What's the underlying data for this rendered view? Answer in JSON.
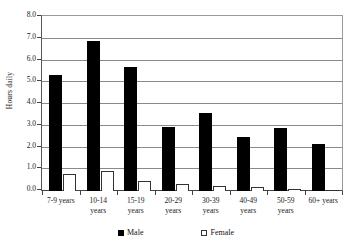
{
  "chart_data": {
    "type": "bar",
    "title": "",
    "xlabel": "",
    "ylabel": "Hours daily",
    "ylim": [
      0,
      8
    ],
    "ytick_step": 1,
    "grid": true,
    "legend_position": "bottom",
    "categories": [
      "7-9 years",
      "10-14 years",
      "15-19 years",
      "20-29 years",
      "30-39 years",
      "40-49 years",
      "50-59 years",
      "60+ years"
    ],
    "category_lines": [
      [
        "7-9 years"
      ],
      [
        "10-14",
        "years"
      ],
      [
        "15-19",
        "years"
      ],
      [
        "20-29",
        "years"
      ],
      [
        "30-39",
        "years"
      ],
      [
        "40-49",
        "years"
      ],
      [
        "50-59",
        "years"
      ],
      [
        "60+ years"
      ]
    ],
    "ytick_labels": [
      "8.0",
      "7.0",
      "6.0",
      "5.0",
      "4.0",
      "3.0",
      "2.0",
      "1.0",
      "0.0"
    ],
    "series": [
      {
        "name": "Male",
        "color": "#000000",
        "values": [
          5.35,
          6.9,
          5.7,
          2.95,
          3.6,
          2.5,
          2.9,
          2.15
        ]
      },
      {
        "name": "Female",
        "color": "#ffffff",
        "values": [
          0.78,
          0.9,
          0.48,
          0.32,
          0.25,
          0.18,
          0.07,
          0.05
        ]
      }
    ]
  },
  "legend": {
    "items": [
      {
        "label": "Male",
        "swatch": "filled-square-icon"
      },
      {
        "label": "Female",
        "swatch": "empty-square-icon"
      }
    ]
  },
  "axis": {
    "y_title": "Hours daily"
  },
  "title_remnant": ""
}
